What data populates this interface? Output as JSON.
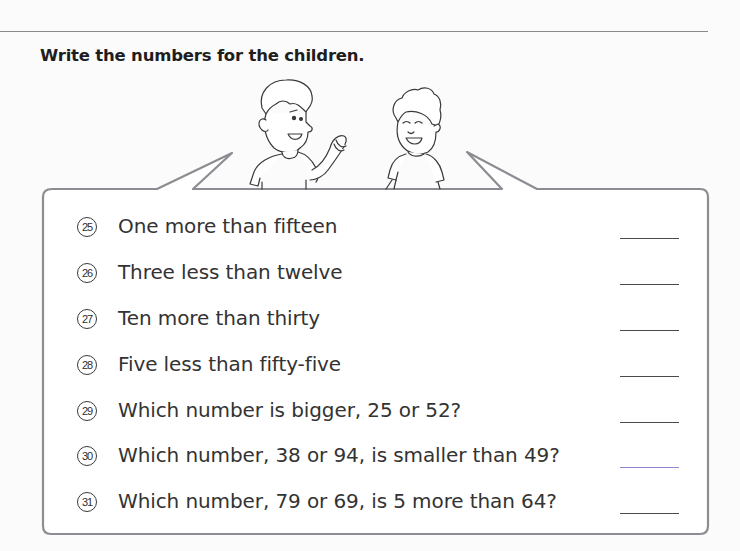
{
  "page": {
    "title": "Write the numbers for the children."
  },
  "illustration": {
    "characters": [
      "boy-left-waving",
      "boy-right-smiling"
    ],
    "speech_bubble": true
  },
  "questions": [
    {
      "number": "25",
      "text": "One more than fifteen",
      "answer": ""
    },
    {
      "number": "26",
      "text": "Three less than twelve",
      "answer": ""
    },
    {
      "number": "27",
      "text": "Ten more than thirty",
      "answer": ""
    },
    {
      "number": "28",
      "text": "Five less than fifty-five",
      "answer": ""
    },
    {
      "number": "29",
      "text": "Which number is bigger, 25 or 52?",
      "answer": ""
    },
    {
      "number": "30",
      "text": "Which number, 38 or 94, is smaller than 49?",
      "answer": ""
    },
    {
      "number": "31",
      "text": "Which number, 79 or 69, is 5 more than 64?",
      "answer": ""
    }
  ],
  "colors": {
    "bubble_border": "#8c8c92",
    "text": "#333333",
    "answer_line": "#4a4a4a",
    "answer_line_highlight": "#8f86d8"
  }
}
